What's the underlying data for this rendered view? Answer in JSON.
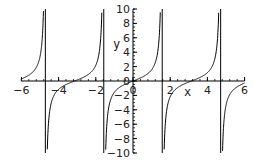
{
  "chart_data": {
    "type": "line",
    "title": "",
    "function": "tan(x)",
    "xlabel": "x",
    "ylabel": "y",
    "xlim": [
      -6,
      6
    ],
    "ylim": [
      -10,
      10
    ],
    "grid": false,
    "legend": null,
    "x_ticks": [
      -6,
      -4,
      -2,
      0,
      2,
      4,
      6
    ],
    "x_tick_labels": [
      "-6",
      "-4",
      "-2",
      "0",
      "2",
      "4",
      "6"
    ],
    "y_ticks": [
      -10,
      -8,
      -6,
      -4,
      -2,
      0,
      2,
      4,
      6,
      8,
      10
    ],
    "y_tick_labels": [
      "-10",
      "-8",
      "-6",
      "-4",
      "-2",
      "0",
      "2",
      "4",
      "6",
      "8",
      "10"
    ],
    "vertical_asymptotes": [
      -4.712,
      -1.571,
      1.571,
      4.712
    ],
    "series": [
      {
        "name": "tan(x)",
        "color": "#000000",
        "x": [
          -6,
          -5.5,
          -5,
          -4.9,
          -4.8,
          -4.75,
          -4.712,
          -4.67,
          -4.6,
          -4.5,
          -4,
          -3.5,
          -3,
          -2.5,
          -2,
          -1.8,
          -1.7,
          -1.65,
          -1.571,
          -1.5,
          -1.4,
          -1,
          -0.5,
          0,
          0.5,
          1,
          1.4,
          1.5,
          1.571,
          1.65,
          1.7,
          1.8,
          2,
          2.5,
          3,
          3.5,
          4,
          4.5,
          4.6,
          4.67,
          4.712,
          4.75,
          4.8,
          5,
          5.5,
          6
        ],
        "y": [
          0.29,
          0.71,
          3.38,
          5.27,
          11.38,
          26.2,
          null,
          -24.0,
          -8.86,
          -4.64,
          -1.16,
          -0.37,
          0.14,
          0.75,
          2.19,
          4.29,
          7.7,
          12.6,
          null,
          -14.1,
          -5.8,
          -1.56,
          -0.55,
          0,
          0.55,
          1.56,
          5.8,
          14.1,
          null,
          -12.6,
          -7.7,
          -4.29,
          -2.19,
          -0.75,
          -0.14,
          0.37,
          1.16,
          4.64,
          8.86,
          24.0,
          null,
          -26.2,
          -11.38,
          -3.38,
          -0.71,
          -0.29
        ]
      }
    ],
    "colors": {
      "curve": "#000000",
      "axes": "#000000",
      "background": "#ffffff"
    }
  },
  "axes": {
    "x_label": "x",
    "y_label": "y"
  }
}
